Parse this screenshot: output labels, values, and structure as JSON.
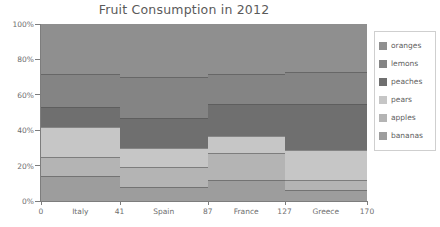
{
  "chart_data": {
    "type": "area",
    "title": "Fruit Consumption in 2012",
    "subtitle": "",
    "xlabel": "",
    "ylabel": "",
    "ylim": [
      0,
      100
    ],
    "ytick_labels": [
      "0%",
      "20%",
      "40%",
      "60%",
      "80%",
      "100%"
    ],
    "ytick_values": [
      0,
      20,
      40,
      60,
      80,
      100
    ],
    "xlim": [
      0,
      170
    ],
    "xtick_labels": [
      "0",
      "41",
      "87",
      "127",
      "170"
    ],
    "xtick_values": [
      0,
      41,
      87,
      127,
      170
    ],
    "categories": [
      "Italy",
      "Spain",
      "France",
      "Greece"
    ],
    "category_x_ranges": [
      [
        0,
        41
      ],
      [
        41,
        87
      ],
      [
        87,
        127
      ],
      [
        127,
        170
      ]
    ],
    "stacked": true,
    "normalized_percent": true,
    "grid": false,
    "legend_position": "right",
    "series": [
      {
        "name": "oranges",
        "color": "#8f8f8f",
        "values": [
          28,
          30,
          28,
          27
        ]
      },
      {
        "name": "lemons",
        "color": "#848484",
        "values": [
          19,
          23,
          17,
          18
        ]
      },
      {
        "name": "peaches",
        "color": "#6f6f6f",
        "values": [
          11,
          18,
          19,
          21
        ]
      },
      {
        "name": "pears",
        "color": "#c6c6c6",
        "values": [
          11,
          17,
          10,
          26
        ]
      },
      {
        "name": "apples",
        "color": "#b4b4b4",
        "values": [
          17,
          11,
          15,
          2
        ]
      },
      {
        "name": "bananas",
        "color": "#9d9d9d",
        "values": [
          14,
          1,
          11,
          6
        ]
      }
    ],
    "series_boundaries_percent": {
      "Italy": [
        100,
        72,
        53,
        42,
        25,
        14,
        0
      ],
      "Spain": [
        100,
        70,
        47,
        30,
        19,
        8,
        0
      ],
      "France": [
        100,
        72,
        55,
        37,
        27,
        12,
        0
      ],
      "Greece": [
        100,
        73,
        55,
        29,
        12,
        6,
        0
      ]
    }
  },
  "legend": {
    "items": [
      {
        "label": "oranges",
        "color": "#8f8f8f"
      },
      {
        "label": "lemons",
        "color": "#848484"
      },
      {
        "label": "peaches",
        "color": "#6f6f6f"
      },
      {
        "label": "pears",
        "color": "#c6c6c6"
      },
      {
        "label": "apples",
        "color": "#b4b4b4"
      },
      {
        "label": "bananas",
        "color": "#9d9d9d"
      }
    ]
  }
}
